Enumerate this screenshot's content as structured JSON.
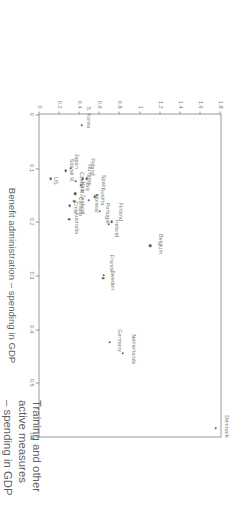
{
  "chart_data": {
    "type": "scatter",
    "title": "",
    "xlabel": "Benefit administration – spending in GDP",
    "ylabel": "Training and other active measures – spending in GDP",
    "xlim": [
      0,
      0.6
    ],
    "ylim": [
      0,
      1.8
    ],
    "xticks": [
      "0",
      "0.1",
      "0.2",
      "0.3",
      "0.4",
      "0.5",
      "0.6"
    ],
    "xtick_values": [
      0,
      0.1,
      0.2,
      0.3,
      0.4,
      0.5,
      0.6
    ],
    "yticks": [
      "0",
      "0.2",
      "0.4",
      "0.6",
      "0.8",
      "1",
      "1.2",
      "1.4",
      "1.6",
      "1.8"
    ],
    "ytick_values": [
      0,
      0.2,
      0.4,
      0.6,
      0.8,
      1.0,
      1.2,
      1.4,
      1.6,
      1.8
    ],
    "grid": false,
    "legend": "none",
    "points": [
      {
        "label": "Denmark",
        "x": 0.585,
        "y": 1.75,
        "lx": -2,
        "ly": 13
      },
      {
        "label": "Netherlands",
        "x": 0.445,
        "y": 0.83,
        "lx": -4,
        "ly": 13
      },
      {
        "label": "Germany",
        "x": 0.425,
        "y": 0.7,
        "lx": -2,
        "ly": 12
      },
      {
        "label": "France",
        "x": 0.3,
        "y": 0.64,
        "lx": -12,
        "ly": 10
      },
      {
        "label": "Sweden",
        "x": 0.305,
        "y": 0.635,
        "lx": 2,
        "ly": 11
      },
      {
        "label": "Belgium",
        "x": 0.245,
        "y": 1.1,
        "lx": -2,
        "ly": 12
      },
      {
        "label": "Finland",
        "x": 0.2,
        "y": 0.72,
        "lx": -10,
        "ly": 11
      },
      {
        "label": "Ireland",
        "x": 0.205,
        "y": 0.69,
        "lx": 4,
        "ly": 10
      },
      {
        "label": "Portugal",
        "x": 0.18,
        "y": 0.6,
        "lx": 2,
        "ly": 10
      },
      {
        "label": "Spain",
        "x": 0.15,
        "y": 0.57,
        "lx": -13,
        "ly": 9
      },
      {
        "label": "Austria",
        "x": 0.153,
        "y": 0.55,
        "lx": 0,
        "ly": 10
      },
      {
        "label": "Norway",
        "x": 0.16,
        "y": 0.49,
        "lx": 3,
        "ly": 10
      },
      {
        "label": "Poland",
        "x": 0.12,
        "y": 0.47,
        "lx": -12,
        "ly": 8
      },
      {
        "label": "Hungary",
        "x": 0.12,
        "y": 0.43,
        "lx": -4,
        "ly": 9
      },
      {
        "label": "Italy",
        "x": 0.132,
        "y": 0.41,
        "lx": 1,
        "ly": 9
      },
      {
        "label": "Czech R.",
        "x": 0.125,
        "y": 0.36,
        "lx": 2,
        "ly": 8
      },
      {
        "label": "New Zealand",
        "x": 0.148,
        "y": 0.355,
        "lx": 4,
        "ly": 9
      },
      {
        "label": "Canada",
        "x": 0.162,
        "y": 0.345,
        "lx": 5,
        "ly": 8
      },
      {
        "label": "Chile",
        "x": 0.17,
        "y": 0.3,
        "lx": 2,
        "ly": 8
      },
      {
        "label": "Australia",
        "x": 0.195,
        "y": 0.295,
        "lx": 4,
        "ly": 9
      },
      {
        "label": "Japan",
        "x": 0.1,
        "y": 0.31,
        "lx": -7,
        "ly": 8
      },
      {
        "label": "Slovak R.",
        "x": 0.105,
        "y": 0.26,
        "lx": 0,
        "ly": 8
      },
      {
        "label": "US",
        "x": 0.12,
        "y": 0.11,
        "lx": 2,
        "ly": 7
      },
      {
        "label": "S. Korea",
        "x": 0.02,
        "y": 0.42,
        "lx": -8,
        "ly": 9
      }
    ]
  },
  "axis_caption": {
    "line1": "Training and other",
    "line2": "active measures",
    "line3": "– spending in GDP"
  }
}
